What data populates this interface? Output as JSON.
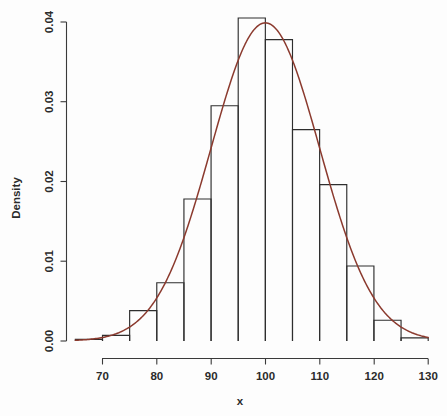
{
  "figure": {
    "background_color": "#fdfdfd",
    "axis_color": "#3a3a3a",
    "bar_stroke_color": "#2e2e2e",
    "curve_color": "#8b3a2e"
  },
  "axes": {
    "x_title": "x",
    "y_title": "Density",
    "x_ticks": [
      "70",
      "80",
      "90",
      "100",
      "110",
      "120",
      "130"
    ],
    "y_ticks": [
      "0.00",
      "0.01",
      "0.02",
      "0.03",
      "0.04"
    ]
  },
  "chart_data": {
    "type": "bar",
    "title": "",
    "subtitle": "",
    "xlabel": "x",
    "ylabel": "Density",
    "xlim": [
      65,
      130
    ],
    "ylim": [
      0,
      0.0405
    ],
    "grid": false,
    "legend": "none",
    "xtick_values": [
      70,
      80,
      90,
      100,
      110,
      120,
      130
    ],
    "xtick_labels": [
      "70",
      "80",
      "90",
      "100",
      "110",
      "120",
      "130"
    ],
    "ytick_values": [
      0.0,
      0.01,
      0.02,
      0.03,
      0.04
    ],
    "ytick_labels": [
      "0.00",
      "0.01",
      "0.02",
      "0.03",
      "0.04"
    ],
    "bin_width": 5,
    "bin_edges": [
      65,
      70,
      75,
      80,
      85,
      90,
      95,
      100,
      105,
      110,
      115,
      120,
      125,
      130
    ],
    "categories": [
      "65-70",
      "70-75",
      "75-80",
      "80-85",
      "85-90",
      "90-95",
      "95-100",
      "100-105",
      "105-110",
      "110-115",
      "115-120",
      "120-125",
      "125-130"
    ],
    "values": [
      0.0002,
      0.0007,
      0.0038,
      0.0073,
      0.0178,
      0.0295,
      0.0405,
      0.0378,
      0.0265,
      0.0196,
      0.0094,
      0.0026,
      0.0004
    ],
    "series": [
      {
        "name": "Histogram density",
        "type": "bar",
        "values": [
          0.0002,
          0.0007,
          0.0038,
          0.0073,
          0.0178,
          0.0295,
          0.0405,
          0.0378,
          0.0265,
          0.0196,
          0.0094,
          0.0026,
          0.0004
        ]
      },
      {
        "name": "Normal density curve",
        "type": "line",
        "color": "#8b3a2e",
        "distribution": "normal",
        "mean": 100,
        "sd": 10,
        "peak_value": 0.0399,
        "x": [
          65,
          67.5,
          70,
          72.5,
          75,
          77.5,
          80,
          82.5,
          85,
          87.5,
          90,
          92.5,
          95,
          97.5,
          100,
          102.5,
          105,
          107.5,
          110,
          112.5,
          115,
          117.5,
          120,
          122.5,
          125,
          127.5,
          130
        ],
        "y": [
          0.00044,
          0.00088,
          0.00175,
          0.00317,
          0.00527,
          0.0079,
          0.01079,
          0.01354,
          0.01579,
          0.0173,
          0.01781,
          0.01724,
          0.0158,
          0.01369,
          0.0114,
          0.0091,
          0.00697,
          0.00513,
          0.00363,
          0.00246,
          0.00158,
          0.00097,
          0.00058,
          0.00033,
          0.00018,
          9e-05,
          4e-05
        ]
      }
    ]
  }
}
